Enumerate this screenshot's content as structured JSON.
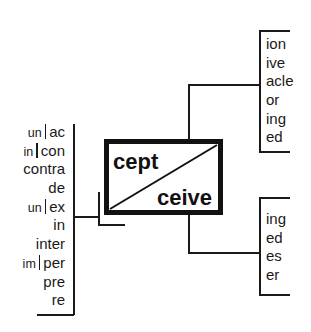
{
  "diagram": {
    "root_box": {
      "top_root": "cept",
      "bottom_root": "ceive"
    },
    "prefixes": [
      {
        "negation": "un",
        "prefix": "ac"
      },
      {
        "negation": "in",
        "prefix": "con"
      },
      {
        "negation": "",
        "prefix": "contra"
      },
      {
        "negation": "",
        "prefix": "de"
      },
      {
        "negation": "un",
        "prefix": "ex"
      },
      {
        "negation": "",
        "prefix": "in"
      },
      {
        "negation": "",
        "prefix": "inter"
      },
      {
        "negation": "im",
        "prefix": "per"
      },
      {
        "negation": "",
        "prefix": "pre"
      },
      {
        "negation": "",
        "prefix": "re"
      }
    ],
    "cept_suffixes": [
      "ion",
      "ive",
      "acle",
      "or",
      "ing",
      "ed"
    ],
    "ceive_suffixes": [
      "ing",
      "ed",
      "es",
      "er"
    ],
    "colors": {
      "line": "#1a1a1a",
      "box_border": "#111111",
      "background": "#ffffff"
    }
  }
}
